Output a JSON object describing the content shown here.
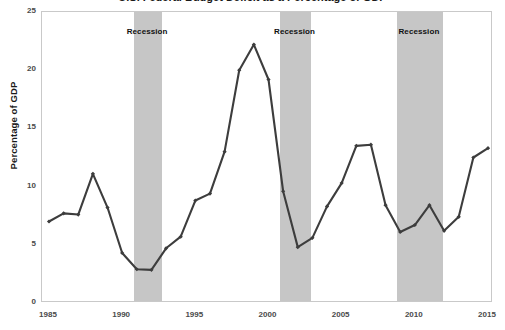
{
  "chart": {
    "title": "U.S. Federal Budget Deficit as a Percentage of GDP",
    "ylabel": "Percentage of GDP",
    "xlabel": "",
    "y_ticks": [
      "0",
      "5",
      "10",
      "15",
      "20",
      "25"
    ],
    "x_ticks": [
      "1985",
      "1990",
      "1995",
      "2000",
      "2005",
      "2010",
      "2015"
    ],
    "recession_labels": [
      "Recession",
      "Recession",
      "Recession"
    ],
    "colors": {
      "line": "#3d3d3d",
      "marker": "#3d3d3d",
      "recession_band": "#c6c6c6",
      "plot_border": "#c9c9c9",
      "tick_text": "#4a4a4a",
      "axis_title": "#1a1a1a",
      "background": "#ffffff"
    }
  },
  "chart_data": {
    "type": "line",
    "title": "U.S. Federal Budget Deficit as a Percentage of GDP",
    "xlabel": "",
    "ylabel": "Percentage of GDP",
    "xlim": [
      1985,
      2015
    ],
    "ylim": [
      0,
      25
    ],
    "ytick_values": [
      0,
      5,
      10,
      15,
      20,
      25
    ],
    "xtick_values": [
      1985,
      1990,
      1995,
      2000,
      2005,
      2010,
      2015
    ],
    "grid": false,
    "legend": null,
    "x": [
      1985,
      1986,
      1987,
      1988,
      1989,
      1990,
      1991,
      1992,
      1993,
      1994,
      1995,
      1996,
      1997,
      1998,
      1999,
      2000,
      2001,
      2002,
      2003,
      2004,
      2005,
      2006,
      2007,
      2008,
      2009,
      2010,
      2011,
      2012,
      2013,
      2014,
      2015
    ],
    "values": [
      7.0,
      7.7,
      7.6,
      11.1,
      8.2,
      4.3,
      2.9,
      2.85,
      4.7,
      5.7,
      8.8,
      9.4,
      13.0,
      20.0,
      22.2,
      19.2,
      9.6,
      4.8,
      5.6,
      8.3,
      10.3,
      13.5,
      13.6,
      8.4,
      6.1,
      6.7,
      8.4,
      6.2,
      7.4,
      12.5,
      13.3
    ],
    "series": [
      {
        "name": "Percentage of GDP",
        "values": [
          7.0,
          7.7,
          7.6,
          11.1,
          8.2,
          4.3,
          2.9,
          2.85,
          4.7,
          5.7,
          8.8,
          9.4,
          13.0,
          20.0,
          22.2,
          19.2,
          9.6,
          4.8,
          5.6,
          8.3,
          10.3,
          13.5,
          13.6,
          8.4,
          6.1,
          6.7,
          8.4,
          6.2,
          7.4,
          12.5,
          13.3
        ],
        "color": "#3d3d3d",
        "marker": "diamond"
      }
    ],
    "annotations": [
      {
        "type": "vspan",
        "label": "Recession",
        "x_start": 1990.8,
        "x_end": 1992.75
      },
      {
        "type": "vspan",
        "label": "Recession",
        "x_start": 2000.8,
        "x_end": 2002.9
      },
      {
        "type": "vspan",
        "label": "Recession",
        "x_start": 2008.8,
        "x_end": 2011.9
      }
    ]
  }
}
